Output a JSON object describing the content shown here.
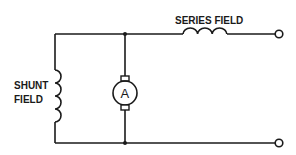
{
  "diagram": {
    "type": "compound-wound DC generator schematic",
    "labels": {
      "series_field": "SERIES FIELD",
      "shunt_field_line1": "SHUNT",
      "shunt_field_line2": "FIELD",
      "armature": "A"
    },
    "components": [
      {
        "id": "series-field",
        "kind": "inductor-coil",
        "label": "SERIES FIELD"
      },
      {
        "id": "shunt-field",
        "kind": "inductor-coil",
        "label": "SHUNT FIELD"
      },
      {
        "id": "armature",
        "kind": "dc-armature",
        "label": "A"
      },
      {
        "id": "terminal-top",
        "kind": "terminal"
      },
      {
        "id": "terminal-bottom",
        "kind": "terminal"
      }
    ],
    "colors": {
      "line": "#1a1a1a",
      "background": "#ffffff"
    }
  }
}
